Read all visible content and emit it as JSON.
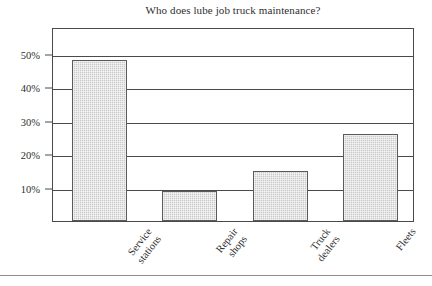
{
  "chart_data": {
    "type": "bar",
    "title": "Who does lube job truck maintenance?",
    "xlabel": "",
    "ylabel": "",
    "categories": [
      "Service stations",
      "Repair shops",
      "Truck dealers",
      "Fleets"
    ],
    "category_lines": [
      [
        "Service",
        "stations"
      ],
      [
        "Repair",
        "shops"
      ],
      [
        "Truck",
        "dealers"
      ],
      [
        "Fleets"
      ]
    ],
    "values": [
      48,
      9,
      15,
      26
    ],
    "value_labels": [
      "48%",
      "9%",
      "15%",
      "26%"
    ],
    "ylim": [
      0,
      58
    ],
    "yticks": [
      10,
      20,
      30,
      40,
      50
    ],
    "ytick_labels": [
      "10%",
      "20%",
      "30%",
      "40%",
      "50%"
    ],
    "grid": true,
    "legend": false,
    "bar_fill_color": "#c9c9c9",
    "bar_edge_color": "#5a5a5a",
    "axis_color": "#4a4a4a",
    "background_color": "#ffffff"
  }
}
